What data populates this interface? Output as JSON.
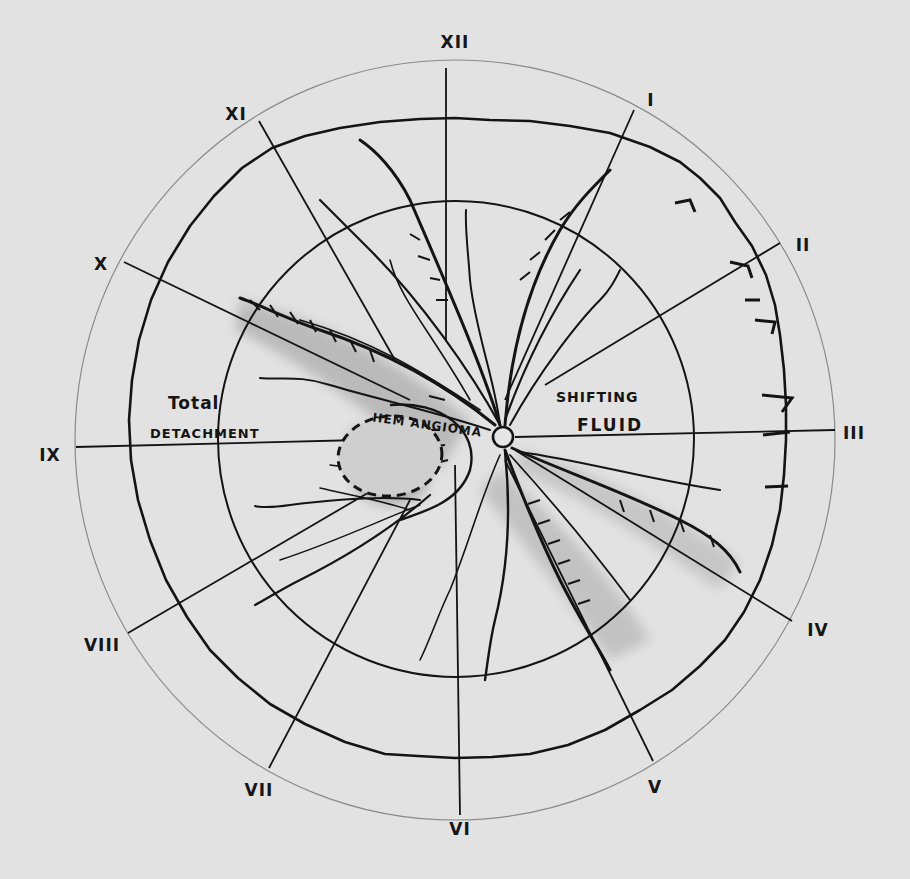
{
  "diagram": {
    "type": "retinal drawing (fundus chart)",
    "background_color": "#e2e2e2",
    "ink_color": "#141414",
    "clock_hours": [
      {
        "label": "XII",
        "x": 455,
        "y": 42
      },
      {
        "label": "I",
        "x": 651,
        "y": 100
      },
      {
        "label": "II",
        "x": 803,
        "y": 245
      },
      {
        "label": "III",
        "x": 854,
        "y": 433
      },
      {
        "label": "IV",
        "x": 818,
        "y": 630
      },
      {
        "label": "V",
        "x": 655,
        "y": 787
      },
      {
        "label": "VI",
        "x": 460,
        "y": 829
      },
      {
        "label": "VII",
        "x": 259,
        "y": 790
      },
      {
        "label": "VIII",
        "x": 102,
        "y": 645
      },
      {
        "label": "IX",
        "x": 50,
        "y": 455
      },
      {
        "label": "X",
        "x": 101,
        "y": 264
      },
      {
        "label": "XI",
        "x": 236,
        "y": 114
      }
    ],
    "annotations": {
      "total_detachment_line1": "Total",
      "total_detachment_line2": "DETACHMENT",
      "shifting_fluid_line1": "SHIFTING",
      "shifting_fluid_line2": "FLUID",
      "hemangioma": "HEM ANGIOMA"
    },
    "circles": {
      "center": [
        455,
        440
      ],
      "inner_radius": 238,
      "equator_radius": 322,
      "outer_radius": 380
    },
    "optic_disc": {
      "x": 503,
      "y": 437,
      "r": 10
    }
  }
}
